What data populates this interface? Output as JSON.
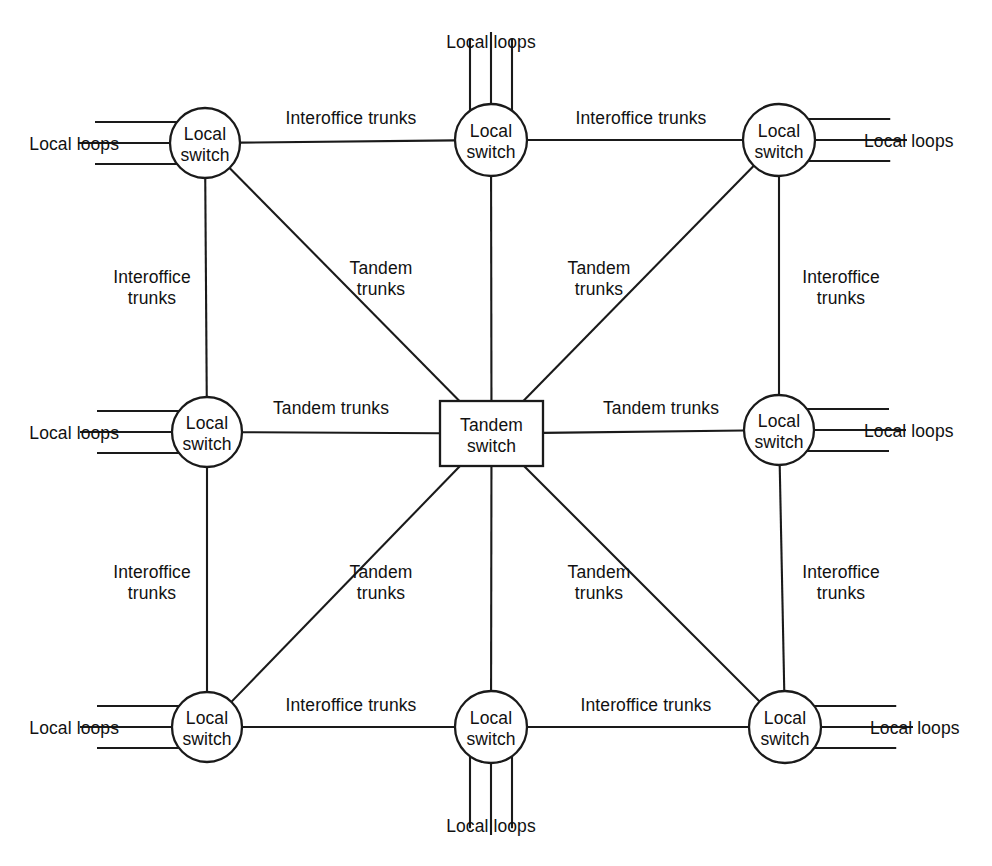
{
  "diagram": {
    "line_color": "#1a1a1a",
    "background_color": "#ffffff",
    "node_fill": "#ffffff",
    "labels": {
      "local_switch": "Local\nswitch",
      "local_switch_line1": "Local",
      "local_switch_line2": "switch",
      "tandem_switch_line1": "Tandem",
      "tandem_switch_line2": "switch",
      "local_loops": "Local loops",
      "interoffice_trunks": "Interoffice trunks",
      "interoffice_trunks_line1": "Interoffice",
      "interoffice_trunks_line2": "trunks",
      "tandem_trunks": "Tandem trunks",
      "tandem_trunks_line1": "Tandem",
      "tandem_trunks_line2": "trunks"
    },
    "nodes": [
      {
        "id": "ls-top-left",
        "type": "local-switch",
        "label_line1": "Local",
        "label_line2": "switch",
        "cx": 205,
        "cy": 143,
        "r": 35
      },
      {
        "id": "ls-top-center",
        "type": "local-switch",
        "label_line1": "Local",
        "label_line2": "switch",
        "cx": 491,
        "cy": 140,
        "r": 36
      },
      {
        "id": "ls-top-right",
        "type": "local-switch",
        "label_line1": "Local",
        "label_line2": "switch",
        "cx": 779,
        "cy": 140,
        "r": 36
      },
      {
        "id": "ls-mid-left",
        "type": "local-switch",
        "label_line1": "Local",
        "label_line2": "switch",
        "cx": 207,
        "cy": 432,
        "r": 35
      },
      {
        "id": "tandem-center",
        "type": "tandem-switch",
        "label_line1": "Tandem",
        "label_line2": "switch",
        "x": 440,
        "y": 401,
        "w": 103,
        "h": 65
      },
      {
        "id": "ls-mid-right",
        "type": "local-switch",
        "label_line1": "Local",
        "label_line2": "switch",
        "cx": 779,
        "cy": 430,
        "r": 35
      },
      {
        "id": "ls-bot-left",
        "type": "local-switch",
        "label_line1": "Local",
        "label_line2": "switch",
        "cx": 207,
        "cy": 727,
        "r": 35
      },
      {
        "id": "ls-bot-center",
        "type": "local-switch",
        "label_line1": "Local",
        "label_line2": "switch",
        "cx": 491,
        "cy": 727,
        "r": 36
      },
      {
        "id": "ls-bot-right",
        "type": "local-switch",
        "label_line1": "Local",
        "label_line2": "switch",
        "cx": 785,
        "cy": 727,
        "r": 36
      }
    ],
    "edges": [
      {
        "id": "e-tl-tc",
        "from": "ls-top-left",
        "to": "ls-top-center",
        "kind": "interoffice",
        "label": "Interoffice trunks",
        "label_x": 351,
        "label_y": 124,
        "lines": 1
      },
      {
        "id": "e-tc-tr",
        "from": "ls-top-center",
        "to": "ls-top-right",
        "kind": "interoffice",
        "label": "Interoffice trunks",
        "label_x": 641,
        "label_y": 124,
        "lines": 1
      },
      {
        "id": "e-tl-ml",
        "from": "ls-top-left",
        "to": "ls-mid-left",
        "kind": "interoffice",
        "label": "Interoffice trunks",
        "label_x": 152,
        "label_y": 283,
        "lines": 2
      },
      {
        "id": "e-tr-mr",
        "from": "ls-top-right",
        "to": "ls-mid-right",
        "kind": "interoffice",
        "label": "Interoffice trunks",
        "label_x": 841,
        "label_y": 283,
        "lines": 2
      },
      {
        "id": "e-ml-bl",
        "from": "ls-mid-left",
        "to": "ls-bot-left",
        "kind": "interoffice",
        "label": "Interoffice trunks",
        "label_x": 152,
        "label_y": 578,
        "lines": 2
      },
      {
        "id": "e-mr-br",
        "from": "ls-mid-right",
        "to": "ls-bot-right",
        "kind": "interoffice",
        "label": "Interoffice trunks",
        "label_x": 841,
        "label_y": 578,
        "lines": 2
      },
      {
        "id": "e-bl-bc",
        "from": "ls-bot-left",
        "to": "ls-bot-center",
        "kind": "interoffice",
        "label": "Interoffice trunks",
        "label_x": 351,
        "label_y": 711,
        "lines": 1
      },
      {
        "id": "e-bc-br",
        "from": "ls-bot-center",
        "to": "ls-bot-right",
        "kind": "interoffice",
        "label": "Interoffice trunks",
        "label_x": 646,
        "label_y": 711,
        "lines": 1
      },
      {
        "id": "e-tl-tandem",
        "from": "ls-top-left",
        "to": "tandem-center",
        "kind": "tandem",
        "label": "Tandem trunks",
        "label_x": 381,
        "label_y": 274,
        "lines": 2
      },
      {
        "id": "e-tc-tandem",
        "from": "ls-top-center",
        "to": "tandem-center",
        "kind": "tandem",
        "label": "",
        "label_x": 0,
        "label_y": 0,
        "lines": 0
      },
      {
        "id": "e-tr-tandem",
        "from": "ls-top-right",
        "to": "tandem-center",
        "kind": "tandem",
        "label": "Tandem trunks",
        "label_x": 599,
        "label_y": 274,
        "lines": 2
      },
      {
        "id": "e-ml-tandem",
        "from": "ls-mid-left",
        "to": "tandem-center",
        "kind": "tandem",
        "label": "Tandem trunks",
        "label_x": 331,
        "label_y": 414,
        "lines": 1
      },
      {
        "id": "e-mr-tandem",
        "from": "ls-mid-right",
        "to": "tandem-center",
        "kind": "tandem",
        "label": "Tandem trunks",
        "label_x": 661,
        "label_y": 414,
        "lines": 1
      },
      {
        "id": "e-bl-tandem",
        "from": "ls-bot-left",
        "to": "tandem-center",
        "kind": "tandem",
        "label": "Tandem trunks",
        "label_x": 381,
        "label_y": 578,
        "lines": 2
      },
      {
        "id": "e-bc-tandem",
        "from": "ls-bot-center",
        "to": "tandem-center",
        "kind": "tandem",
        "label": "",
        "label_x": 0,
        "label_y": 0,
        "lines": 0
      },
      {
        "id": "e-br-tandem",
        "from": "ls-bot-right",
        "to": "tandem-center",
        "kind": "tandem",
        "label": "Tandem trunks",
        "label_x": 599,
        "label_y": 578,
        "lines": 2
      }
    ],
    "local_loop_groups": [
      {
        "id": "loops-top-left",
        "node": "ls-top-left",
        "side": "left",
        "label": "Local loops",
        "label_x": 119,
        "label_y": 150,
        "count": 3
      },
      {
        "id": "loops-top-center",
        "node": "ls-top-center",
        "side": "top",
        "label": "Local loops",
        "label_x": 491,
        "label_y": 48,
        "count": 3
      },
      {
        "id": "loops-top-right",
        "node": "ls-top-right",
        "side": "right",
        "label": "Local loops",
        "label_x": 864,
        "label_y": 147,
        "count": 3
      },
      {
        "id": "loops-mid-left",
        "node": "ls-mid-left",
        "side": "left",
        "label": "Local loops",
        "label_x": 119,
        "label_y": 439,
        "count": 3
      },
      {
        "id": "loops-mid-right",
        "node": "ls-mid-right",
        "side": "right",
        "label": "Local loops",
        "label_x": 864,
        "label_y": 437,
        "count": 3
      },
      {
        "id": "loops-bot-left",
        "node": "ls-bot-left",
        "side": "left",
        "label": "Local loops",
        "label_x": 119,
        "label_y": 734,
        "count": 3
      },
      {
        "id": "loops-bot-center",
        "node": "ls-bot-center",
        "side": "bottom",
        "label": "Local loops",
        "label_x": 491,
        "label_y": 832,
        "count": 3
      },
      {
        "id": "loops-bot-right",
        "node": "ls-bot-right",
        "side": "right",
        "label": "Local loops",
        "label_x": 870,
        "label_y": 734,
        "count": 3
      }
    ]
  }
}
